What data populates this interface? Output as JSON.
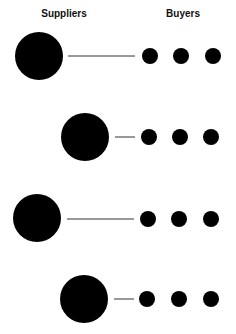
{
  "headers": {
    "suppliers": "Suppliers",
    "buyers": "Buyers"
  },
  "colors": {
    "node": "#000000",
    "line": "#333333",
    "background": "#ffffff"
  },
  "rows": [
    {
      "supplier": {
        "cx": 39,
        "cy": 56,
        "r": 24
      },
      "line": {
        "x1": 68,
        "x2": 135,
        "y": 56
      },
      "buyers": [
        {
          "cx": 150,
          "cy": 56,
          "r": 8
        },
        {
          "cx": 181,
          "cy": 56,
          "r": 8
        },
        {
          "cx": 213,
          "cy": 56,
          "r": 8
        }
      ]
    },
    {
      "supplier": {
        "cx": 85,
        "cy": 137,
        "r": 24
      },
      "line": {
        "x1": 115,
        "x2": 135,
        "y": 137
      },
      "buyers": [
        {
          "cx": 149,
          "cy": 137,
          "r": 8
        },
        {
          "cx": 180,
          "cy": 137,
          "r": 8
        },
        {
          "cx": 211,
          "cy": 137,
          "r": 8
        }
      ]
    },
    {
      "supplier": {
        "cx": 37,
        "cy": 218,
        "r": 24
      },
      "line": {
        "x1": 67,
        "x2": 134,
        "y": 219
      },
      "buyers": [
        {
          "cx": 148,
          "cy": 219,
          "r": 8
        },
        {
          "cx": 179,
          "cy": 219,
          "r": 8
        },
        {
          "cx": 211,
          "cy": 219,
          "r": 8
        }
      ]
    },
    {
      "supplier": {
        "cx": 84,
        "cy": 299,
        "r": 24
      },
      "line": {
        "x1": 114,
        "x2": 134,
        "y": 299
      },
      "buyers": [
        {
          "cx": 147,
          "cy": 299,
          "r": 8
        },
        {
          "cx": 179,
          "cy": 299,
          "r": 8
        },
        {
          "cx": 211,
          "cy": 299,
          "r": 8
        }
      ]
    }
  ]
}
